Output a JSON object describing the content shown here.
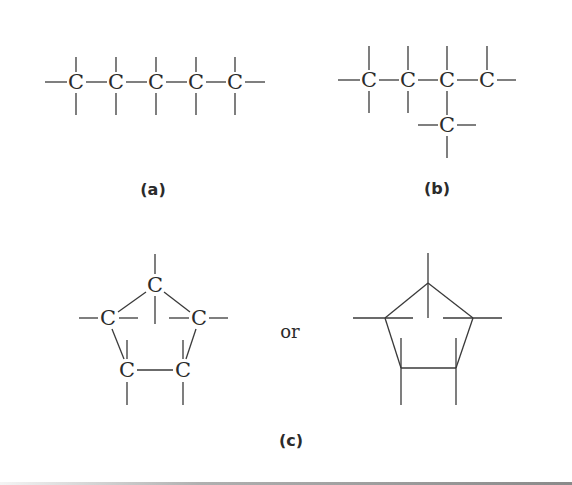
{
  "figure": {
    "atom_symbol": "C",
    "conjunction": "or",
    "colors": {
      "ink": "#2b2b2b",
      "bond": "#3a3a3a",
      "rule": "#8a8a8a",
      "background": "#ffffff"
    },
    "panels": [
      {
        "id": "a",
        "label": "(a)",
        "description": "Straight chain of five carbon atoms (pentane skeleton)",
        "carbon_count": 5
      },
      {
        "id": "b",
        "label": "(b)",
        "description": "Branched chain: four carbons in a row with one carbon branching below the third carbon",
        "carbon_count": 5
      },
      {
        "id": "c",
        "label": "(c)",
        "description": "Five-membered carbon ring (cyclopentane skeleton), shown with atom symbols and as a line drawing",
        "carbon_count": 5,
        "variants": [
          "with-atom-symbols",
          "skeletal-line-drawing"
        ]
      }
    ]
  }
}
